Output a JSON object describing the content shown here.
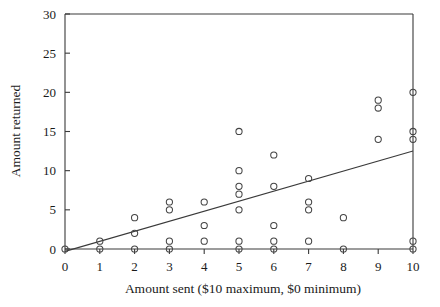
{
  "chart_data": {
    "type": "scatter",
    "title": "",
    "xlabel": "Amount sent ($10 maximum, $0 minimum)",
    "ylabel": "Amount returned",
    "xlim": [
      0,
      10
    ],
    "ylim": [
      0,
      30
    ],
    "xticks": [
      0,
      1,
      2,
      3,
      4,
      5,
      6,
      7,
      8,
      9,
      10
    ],
    "yticks": [
      0,
      5,
      10,
      15,
      20,
      25,
      30
    ],
    "xtick_labels": [
      "0",
      "1",
      "2",
      "3",
      "4",
      "5",
      "6",
      "7",
      "8",
      "9",
      "10"
    ],
    "ytick_labels": [
      "0",
      "5",
      "10",
      "15",
      "20",
      "25",
      "30"
    ],
    "grid": false,
    "legend": false,
    "marker": "open-circle",
    "points": [
      {
        "x": 0,
        "y": 0
      },
      {
        "x": 1,
        "y": 1
      },
      {
        "x": 1,
        "y": 0
      },
      {
        "x": 2,
        "y": 4
      },
      {
        "x": 2,
        "y": 2
      },
      {
        "x": 2,
        "y": 0
      },
      {
        "x": 3,
        "y": 6
      },
      {
        "x": 3,
        "y": 5
      },
      {
        "x": 3,
        "y": 1
      },
      {
        "x": 3,
        "y": 0
      },
      {
        "x": 4,
        "y": 6
      },
      {
        "x": 4,
        "y": 3
      },
      {
        "x": 4,
        "y": 1
      },
      {
        "x": 5,
        "y": 15
      },
      {
        "x": 5,
        "y": 10
      },
      {
        "x": 5,
        "y": 8
      },
      {
        "x": 5,
        "y": 7
      },
      {
        "x": 5,
        "y": 5
      },
      {
        "x": 5,
        "y": 1
      },
      {
        "x": 5,
        "y": 0
      },
      {
        "x": 6,
        "y": 12
      },
      {
        "x": 6,
        "y": 8
      },
      {
        "x": 6,
        "y": 3
      },
      {
        "x": 6,
        "y": 1
      },
      {
        "x": 6,
        "y": 0
      },
      {
        "x": 7,
        "y": 9
      },
      {
        "x": 7,
        "y": 6
      },
      {
        "x": 7,
        "y": 5
      },
      {
        "x": 7,
        "y": 1
      },
      {
        "x": 8,
        "y": 4
      },
      {
        "x": 8,
        "y": 0
      },
      {
        "x": 9,
        "y": 19
      },
      {
        "x": 9,
        "y": 18
      },
      {
        "x": 9,
        "y": 14
      },
      {
        "x": 10,
        "y": 20
      },
      {
        "x": 10,
        "y": 15
      },
      {
        "x": 10,
        "y": 14
      },
      {
        "x": 10,
        "y": 1
      },
      {
        "x": 10,
        "y": 0
      }
    ],
    "trendline": {
      "type": "linear-fit",
      "x_start": 0,
      "y_start": -0.3,
      "x_end": 10,
      "y_end": 12.5
    }
  }
}
